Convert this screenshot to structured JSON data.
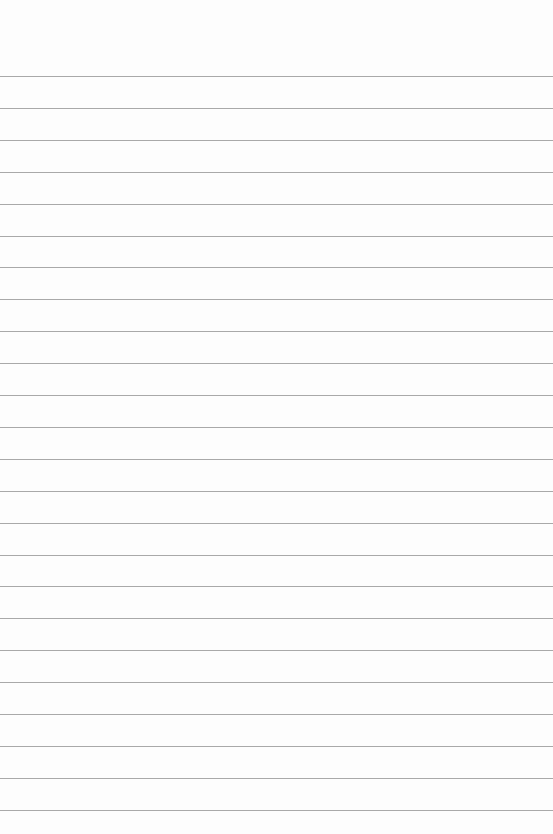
{
  "page": {
    "type": "lined-paper",
    "background": "#fdfdfd",
    "line_color": "#9a9a9a",
    "first_line_y": 76,
    "line_spacing": 31.9,
    "line_count": 24,
    "text": []
  }
}
